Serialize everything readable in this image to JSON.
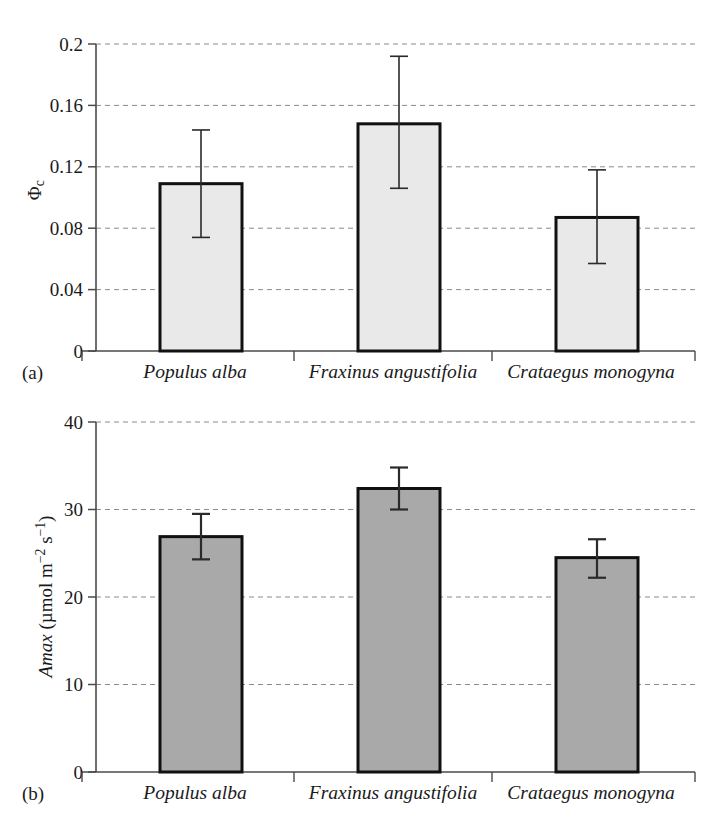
{
  "figure": {
    "background_color": "#ffffff",
    "panels": [
      {
        "id": "a",
        "panel_label": "(a)",
        "bar_fill_color": "#e9e9e9",
        "bar_edge_color": "#111111"
      },
      {
        "id": "b",
        "panel_label": "(b)",
        "bar_fill_color": "#a9a9a9",
        "bar_edge_color": "#111111"
      }
    ]
  },
  "chart_data": [
    {
      "type": "bar",
      "panel": "(a)",
      "title": "",
      "xlabel": "",
      "ylabel": "Φc",
      "ylabel_parts": {
        "symbol": "Φ",
        "subscript": "c"
      },
      "categories": [
        "Populus alba",
        "Fraxinus angustifolia",
        "Crataegus monogyna"
      ],
      "values": [
        0.109,
        0.148,
        0.087
      ],
      "errors_upper": [
        0.144,
        0.192,
        0.118
      ],
      "errors_lower": [
        0.074,
        0.106,
        0.057
      ],
      "ylim": [
        0,
        0.2
      ],
      "yticks": [
        0,
        0.04,
        0.08,
        0.12,
        0.16,
        0.2
      ],
      "ytick_labels": [
        "0",
        "0.04",
        "0.08",
        "0.12",
        "0.16",
        "0.2"
      ],
      "grid": true,
      "grid_style": "dashed",
      "legend": "none"
    },
    {
      "type": "bar",
      "panel": "(b)",
      "title": "",
      "xlabel": "",
      "ylabel": "Amax (µmol m−2 s−1)",
      "ylabel_parts": {
        "symbol": "Amax",
        "unit_open": " (µmol m",
        "exp1": "−2",
        "unit_mid": " s",
        "exp2": "−1",
        "unit_close": ")"
      },
      "categories": [
        "Populus alba",
        "Fraxinus angustifolia",
        "Crataegus monogyna"
      ],
      "values": [
        26.9,
        32.4,
        24.5
      ],
      "errors_upper": [
        29.5,
        34.8,
        26.6
      ],
      "errors_lower": [
        24.3,
        30.0,
        22.2
      ],
      "ylim": [
        0,
        40
      ],
      "yticks": [
        0,
        10,
        20,
        30,
        40
      ],
      "ytick_labels": [
        "0",
        "10",
        "20",
        "30",
        "40"
      ],
      "grid": true,
      "grid_style": "dashed",
      "legend": "none"
    }
  ]
}
